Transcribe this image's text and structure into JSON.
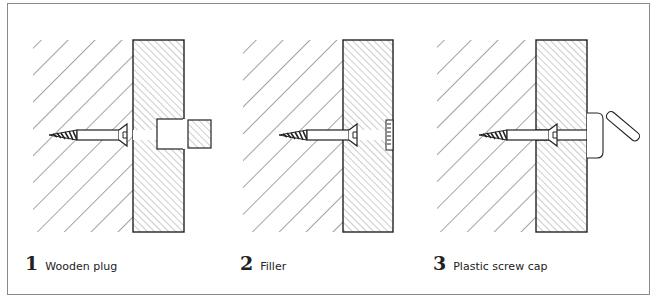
{
  "figure": {
    "panels": [
      {
        "number": "1",
        "label": "Wooden plug",
        "covering": "wooden-plug"
      },
      {
        "number": "2",
        "label": "Filler",
        "covering": "filler"
      },
      {
        "number": "3",
        "label": "Plastic screw cap",
        "covering": "plastic-screw-cap"
      }
    ],
    "colors": {
      "line": "#2a2a2a",
      "frame": "#8a8a8a",
      "background": "#ffffff"
    }
  }
}
